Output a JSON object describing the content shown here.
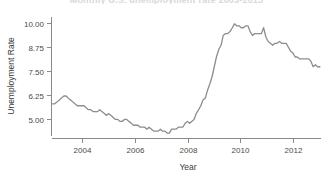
{
  "figure": {
    "title_partial": "Monthly U.S. unemployment rate 2003-2013",
    "background_color": "#ffffff",
    "line_color": "#8d8d8d",
    "axis_color": "#8a8a8a",
    "text_color": "#3a3a3a"
  },
  "chart_data": {
    "type": "line",
    "title": "Monthly U.S. unemployment rate 2003-2013",
    "xlabel": "Year",
    "ylabel": "Unemployment Rate",
    "xlim": [
      2003.0,
      2013.0
    ],
    "ylim": [
      4.25,
      10.35
    ],
    "xticks": [
      2004,
      2006,
      2008,
      2010,
      2012
    ],
    "xtick_labels": [
      "2004",
      "2006",
      "2008",
      "2010",
      "2012"
    ],
    "yticks": [
      5.0,
      6.25,
      7.5,
      8.75,
      10.0
    ],
    "ytick_labels": [
      "5.00",
      "6.25",
      "7.50",
      "8.75",
      "10.00"
    ],
    "grid": false,
    "legend": false,
    "series": [
      {
        "name": "Unemployment Rate",
        "color": "#8d8d8d",
        "x": [
          2003.04,
          2003.12,
          2003.21,
          2003.29,
          2003.37,
          2003.46,
          2003.54,
          2003.62,
          2003.71,
          2003.79,
          2003.87,
          2003.96,
          2004.04,
          2004.12,
          2004.21,
          2004.29,
          2004.37,
          2004.46,
          2004.54,
          2004.62,
          2004.71,
          2004.79,
          2004.87,
          2004.96,
          2005.04,
          2005.12,
          2005.21,
          2005.29,
          2005.37,
          2005.46,
          2005.54,
          2005.62,
          2005.71,
          2005.79,
          2005.87,
          2005.96,
          2006.04,
          2006.12,
          2006.21,
          2006.29,
          2006.37,
          2006.46,
          2006.54,
          2006.62,
          2006.71,
          2006.79,
          2006.87,
          2006.96,
          2007.04,
          2007.12,
          2007.21,
          2007.29,
          2007.37,
          2007.46,
          2007.54,
          2007.62,
          2007.71,
          2007.79,
          2007.87,
          2007.96,
          2008.04,
          2008.12,
          2008.21,
          2008.29,
          2008.37,
          2008.46,
          2008.54,
          2008.62,
          2008.71,
          2008.79,
          2008.87,
          2008.96,
          2009.04,
          2009.12,
          2009.21,
          2009.29,
          2009.37,
          2009.46,
          2009.54,
          2009.62,
          2009.71,
          2009.79,
          2009.87,
          2009.96,
          2010.04,
          2010.12,
          2010.21,
          2010.29,
          2010.37,
          2010.46,
          2010.54,
          2010.62,
          2010.71,
          2010.79,
          2010.87,
          2010.96,
          2011.04,
          2011.12,
          2011.21,
          2011.29,
          2011.37,
          2011.46,
          2011.54,
          2011.62,
          2011.71,
          2011.79,
          2011.87,
          2011.96,
          2012.04,
          2012.12,
          2012.21,
          2012.29,
          2012.37,
          2012.46,
          2012.54,
          2012.62,
          2012.71,
          2012.79,
          2012.87,
          2012.96
        ],
        "y": [
          5.9,
          5.9,
          6.0,
          6.1,
          6.2,
          6.3,
          6.3,
          6.2,
          6.1,
          6.0,
          5.9,
          5.8,
          5.8,
          5.8,
          5.8,
          5.7,
          5.6,
          5.6,
          5.5,
          5.5,
          5.5,
          5.6,
          5.5,
          5.4,
          5.3,
          5.4,
          5.3,
          5.2,
          5.1,
          5.1,
          5.0,
          5.0,
          5.1,
          5.1,
          5.0,
          4.9,
          4.8,
          4.8,
          4.8,
          4.7,
          4.7,
          4.7,
          4.6,
          4.7,
          4.6,
          4.5,
          4.5,
          4.5,
          4.6,
          4.5,
          4.5,
          4.4,
          4.4,
          4.6,
          4.6,
          4.6,
          4.7,
          4.7,
          4.7,
          4.9,
          5.0,
          4.9,
          5.0,
          5.1,
          5.4,
          5.6,
          5.8,
          6.1,
          6.2,
          6.6,
          6.9,
          7.3,
          7.8,
          8.3,
          8.7,
          8.9,
          9.4,
          9.5,
          9.5,
          9.6,
          9.8,
          10.0,
          9.9,
          9.9,
          9.8,
          9.8,
          9.9,
          9.9,
          9.6,
          9.4,
          9.5,
          9.5,
          9.5,
          9.5,
          9.8,
          9.3,
          9.1,
          9.0,
          8.9,
          9.0,
          9.0,
          9.1,
          9.0,
          9.0,
          9.0,
          8.8,
          8.6,
          8.5,
          8.3,
          8.3,
          8.2,
          8.2,
          8.2,
          8.2,
          8.2,
          8.1,
          7.8,
          7.9,
          7.8,
          7.8
        ]
      }
    ]
  }
}
